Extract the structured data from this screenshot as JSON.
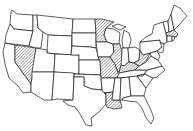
{
  "map": {
    "type": "choropleth-outline",
    "region": "Contiguous United States",
    "style": {
      "line_color": "#1a1a1a",
      "background": "#ffffff",
      "highlight_pattern": "diagonal-hatch",
      "hatch_color": "#555555"
    },
    "highlighted_states": [
      "Nevada",
      "Minnesota",
      "Illinois",
      "Missouri",
      "Kentucky",
      "West Virginia",
      "Louisiana",
      "Massachusetts"
    ]
  }
}
